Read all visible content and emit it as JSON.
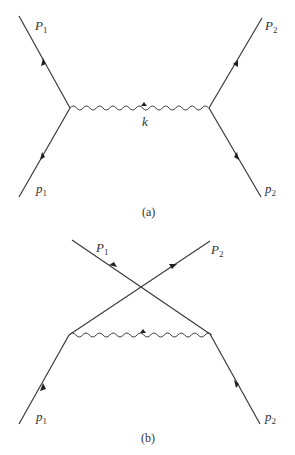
{
  "diagrams": [
    {
      "id": "a",
      "caption": "(a)",
      "labels": {
        "P1": {
          "main": "P",
          "sub": "1"
        },
        "P2": {
          "main": "P",
          "sub": "2"
        },
        "p1": {
          "main": "p",
          "sub": "1"
        },
        "p2": {
          "main": "p",
          "sub": "2"
        },
        "k": "k"
      },
      "type": "direct exchange"
    },
    {
      "id": "b",
      "caption": "(b)",
      "labels": {
        "P1": {
          "main": "P",
          "sub": "1"
        },
        "P2": {
          "main": "P",
          "sub": "2"
        },
        "p1": {
          "main": "p",
          "sub": "1"
        },
        "p2": {
          "main": "p",
          "sub": "2"
        }
      },
      "type": "crossed exchange"
    }
  ]
}
